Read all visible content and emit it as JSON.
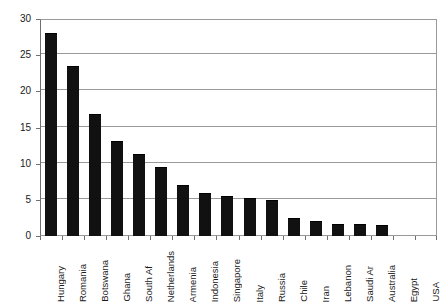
{
  "chart_data": {
    "type": "bar",
    "title": "",
    "subtitle": "",
    "xlabel": "",
    "ylabel": "",
    "ylim": [
      0,
      30
    ],
    "yticks": [
      0,
      5,
      10,
      15,
      20,
      25,
      30
    ],
    "ytick_labels": [
      "0",
      "5",
      "10",
      "15",
      "20",
      "25",
      "30"
    ],
    "grid": "horizontal",
    "legend": "none",
    "bar_color": "#111111",
    "gridline_color": "#9a9a9a",
    "axis_color": "#6f6f6f",
    "categories": [
      "Hungary",
      "Romania",
      "Botswana",
      "Ghana",
      "South Af",
      "Netherlands",
      "Armenia",
      "Indonesia",
      "Singapore",
      "Italy",
      "Russia",
      "Chile",
      "Iran",
      "Lebanon",
      "Saudi Ar",
      "Australia",
      "Egypt",
      "USA"
    ],
    "values": [
      28.0,
      23.5,
      16.8,
      13.2,
      11.4,
      9.5,
      7.1,
      5.9,
      5.5,
      5.3,
      5.0,
      2.5,
      2.1,
      1.6,
      1.6,
      1.5,
      0.0,
      0.0
    ]
  }
}
